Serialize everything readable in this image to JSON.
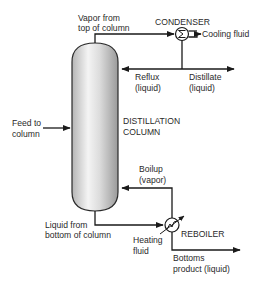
{
  "diagram": {
    "type": "process-flow",
    "colors": {
      "line": "#1a1a1a",
      "text": "#2a2a2a",
      "column_fill_light": "#f2f2f2",
      "column_fill_dark": "#9c9c9c",
      "background": "#ffffff"
    },
    "units": {
      "column": {
        "label_line1": "DISTILLATION",
        "label_line2": "COLUMN",
        "icon": "column-vessel-icon"
      },
      "condenser": {
        "label": "CONDENSER",
        "icon": "condenser-icon"
      },
      "reboiler": {
        "label": "REBOILER",
        "icon": "heat-exchanger-icon"
      }
    },
    "streams": {
      "vapor_top": {
        "line1": "Vapor from",
        "line2": "top of column"
      },
      "cooling_fluid": {
        "label": "Cooling fluid"
      },
      "reflux": {
        "line1": "Reflux",
        "line2": "(liquid)"
      },
      "distillate": {
        "line1": "Distillate",
        "line2": "(liquid)"
      },
      "feed": {
        "line1": "Feed to",
        "line2": "column"
      },
      "boilup": {
        "line1": "Boilup",
        "line2": "(vapor)"
      },
      "liquid_bottom": {
        "line1": "Liquid from",
        "line2": "bottom of column"
      },
      "heating_fluid": {
        "line1": "Heating",
        "line2": "fluid"
      },
      "bottoms": {
        "line1": "Bottoms",
        "line2": "product (liquid)"
      }
    }
  }
}
